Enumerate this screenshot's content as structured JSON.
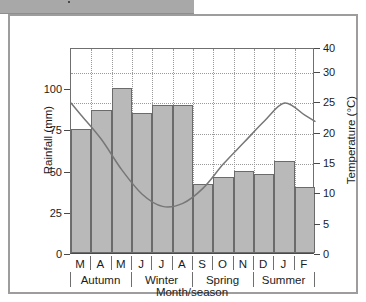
{
  "header": {
    "strip_color": "#a8a8a8"
  },
  "chart_data": {
    "type": "bar",
    "title": "",
    "subtitle": "",
    "xlabel": "Month/season",
    "ylabel": "Rainfall (mm)",
    "y2label": "Temperature (°C)",
    "categories": [
      "M",
      "A",
      "M",
      "J",
      "J",
      "A",
      "S",
      "O",
      "N",
      "D",
      "J",
      "F"
    ],
    "group_labels": [
      "Autumn",
      "Winter",
      "Spring",
      "Summer"
    ],
    "groups": [
      {
        "name": "Autumn",
        "months": [
          "M",
          "A",
          "M"
        ]
      },
      {
        "name": "Winter",
        "months": [
          "J",
          "J",
          "A"
        ]
      },
      {
        "name": "Spring",
        "months": [
          "S",
          "O",
          "N"
        ]
      },
      {
        "name": "Summer",
        "months": [
          "D",
          "J",
          "F"
        ]
      }
    ],
    "series": [
      {
        "name": "Rainfall",
        "type": "bar",
        "unit": "mm",
        "axis": "left",
        "color": "#b9b9b9",
        "edge_color": "#6b6b6b",
        "values": [
          75,
          87,
          100,
          85,
          90,
          90,
          42,
          46,
          50,
          48,
          56,
          40
        ]
      },
      {
        "name": "Temperature",
        "type": "line",
        "unit": "°C",
        "axis": "right",
        "color": "#777777",
        "values": [
          23,
          19,
          14,
          10,
          8,
          8.5,
          11,
          15,
          18.5,
          22,
          25,
          23
        ]
      }
    ],
    "ylim": [
      0,
      125
    ],
    "yticks": [
      0,
      25,
      50,
      75,
      100
    ],
    "ytick_labels": [
      "0",
      "25",
      "50",
      "75",
      "100"
    ],
    "y2lim": [
      0,
      40
    ],
    "y2ticks": [
      0,
      5,
      10,
      15,
      20,
      25,
      30,
      40
    ],
    "y2tick_labels": [
      "0",
      "5",
      "10",
      "15",
      "20",
      "25",
      "30",
      "40"
    ],
    "grid": true,
    "grid_style": "dotted",
    "legend": "none"
  }
}
